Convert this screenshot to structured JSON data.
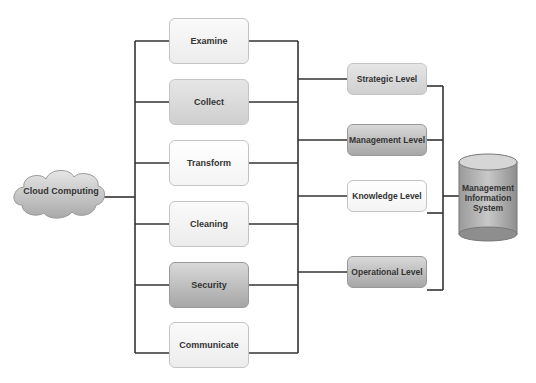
{
  "diagram": {
    "source": {
      "label": "Cloud Computing",
      "shape": "cloud"
    },
    "processes": [
      {
        "label": "Examine",
        "style": "light"
      },
      {
        "label": "Collect",
        "style": "mid"
      },
      {
        "label": "Transform",
        "style": "white"
      },
      {
        "label": "Cleaning",
        "style": "light"
      },
      {
        "label": "Security",
        "style": "dark"
      },
      {
        "label": "Communicate",
        "style": "light"
      }
    ],
    "levels": [
      {
        "label": "Strategic Level",
        "style": "mid"
      },
      {
        "label": "Management Level",
        "style": "dark"
      },
      {
        "label": "Knowledge Level",
        "style": "white"
      },
      {
        "label": "Operational Level",
        "style": "dark"
      }
    ],
    "target": {
      "label_lines": [
        "Management",
        "Information",
        "System"
      ],
      "shape": "cylinder"
    },
    "colors": {
      "line": "#333333",
      "box_border": "#c4c4c4",
      "dark_fill": "#a6a6a6"
    }
  }
}
